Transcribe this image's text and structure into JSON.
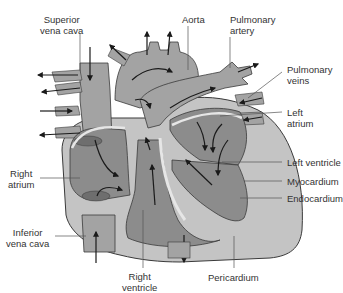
{
  "diagram": {
    "colors": {
      "background": "#ffffff",
      "vessel": "#a3a3a3",
      "chamber": "#8c8c8c",
      "wall": "#c4c4c4",
      "endocardium": "#e6e6e6",
      "valve": "#6e6e6e",
      "outline": "#3a3a3a",
      "arrow": "#1a1a1a",
      "leader": "#555555",
      "text": "#333333"
    },
    "labels": [
      {
        "id": "superior-vena-cava",
        "text": "Superior\nvena cava"
      },
      {
        "id": "aorta",
        "text": "Aorta"
      },
      {
        "id": "pulmonary-artery",
        "text": "Pulmonary\nartery"
      },
      {
        "id": "pulmonary-veins",
        "text": "Pulmonary\nveins"
      },
      {
        "id": "left-atrium",
        "text": "Left\natrium"
      },
      {
        "id": "left-ventricle",
        "text": "Left ventricle"
      },
      {
        "id": "myocardium",
        "text": "Myocardium"
      },
      {
        "id": "endocardium",
        "text": "Endocardium"
      },
      {
        "id": "right-atrium",
        "text": "Right\natrium"
      },
      {
        "id": "inferior-vena-cava",
        "text": "Inferior\nvena cava"
      },
      {
        "id": "right-ventricle",
        "text": "Right\nventricle"
      },
      {
        "id": "pericardium",
        "text": "Pericardium"
      }
    ]
  }
}
